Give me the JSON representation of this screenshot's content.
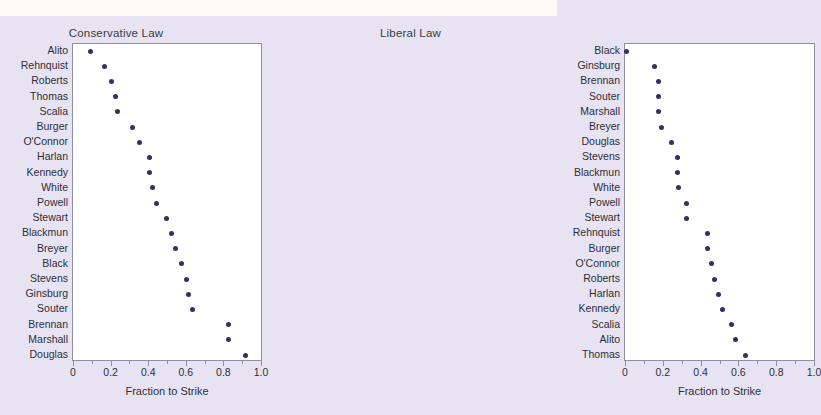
{
  "figure": {
    "background_color": "#e7e3f2",
    "plot_background_color": "#ffffff",
    "marker_color": "#3b2c63",
    "frame_color": "#8e8ea4",
    "text_color": "#2f2f38"
  },
  "chart_data": [
    {
      "type": "scatter",
      "title": "Conservative Law",
      "xlabel": "Fraction to Strike",
      "ylabel": "",
      "xlim": [
        0,
        1.0
      ],
      "xticks": [
        0,
        0.2,
        0.4,
        0.6,
        0.8,
        1.0
      ],
      "xticklabels": [
        "0",
        "0.2",
        "0.4",
        "0.6",
        "0.8",
        "1.0"
      ],
      "grid": false,
      "legend": "none",
      "orientation": "dot-plot, categories top-to-bottom ascending in value",
      "categories": [
        "Alito",
        "Rehnquist",
        "Roberts",
        "Thomas",
        "Scalia",
        "Burger",
        "O'Connor",
        "Harlan",
        "Kennedy",
        "White",
        "Powell",
        "Stewart",
        "Blackmun",
        "Breyer",
        "Black",
        "Stevens",
        "Ginsburg",
        "Souter",
        "Brennan",
        "Marshall",
        "Douglas"
      ],
      "values": [
        0.09,
        0.16,
        0.2,
        0.22,
        0.23,
        0.31,
        0.35,
        0.4,
        0.4,
        0.42,
        0.44,
        0.49,
        0.52,
        0.54,
        0.57,
        0.6,
        0.61,
        0.63,
        0.82,
        0.82,
        0.91
      ]
    },
    {
      "type": "scatter",
      "title": "Liberal Law",
      "xlabel": "Fraction to Strike",
      "ylabel": "",
      "xlim": [
        0,
        1.0
      ],
      "xticks": [
        0,
        0.2,
        0.4,
        0.6,
        0.8,
        1.0
      ],
      "xticklabels": [
        "0",
        "0.2",
        "0.4",
        "0.6",
        "0.8",
        "1.0"
      ],
      "grid": false,
      "legend": "none",
      "orientation": "dot-plot, categories top-to-bottom ascending in value",
      "categories": [
        "Black",
        "Ginsburg",
        "Brennan",
        "Souter",
        "Marshall",
        "Breyer",
        "Douglas",
        "Stevens",
        "Blackmun",
        "White",
        "Powell",
        "Stewart",
        "Rehnquist",
        "Burger",
        "O'Connor",
        "Roberts",
        "Harlan",
        "Kennedy",
        "Scalia",
        "Alito",
        "Thomas"
      ],
      "values": [
        0.0,
        0.15,
        0.17,
        0.17,
        0.17,
        0.19,
        0.24,
        0.27,
        0.27,
        0.28,
        0.32,
        0.32,
        0.43,
        0.43,
        0.45,
        0.47,
        0.49,
        0.51,
        0.56,
        0.58,
        0.63
      ]
    }
  ]
}
